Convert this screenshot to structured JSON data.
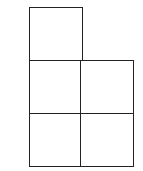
{
  "diagram": {
    "type": "polyomino-grid",
    "line_color": "#222222",
    "cell_size_px": 53,
    "cells": [
      {
        "row": 0,
        "col": 0,
        "x": 29,
        "y": 7
      },
      {
        "row": 1,
        "col": 0,
        "x": 29,
        "y": 60
      },
      {
        "row": 1,
        "col": 1,
        "x": 80,
        "y": 60
      },
      {
        "row": 2,
        "col": 0,
        "x": 29,
        "y": 113
      },
      {
        "row": 2,
        "col": 1,
        "x": 80,
        "y": 113
      }
    ]
  }
}
